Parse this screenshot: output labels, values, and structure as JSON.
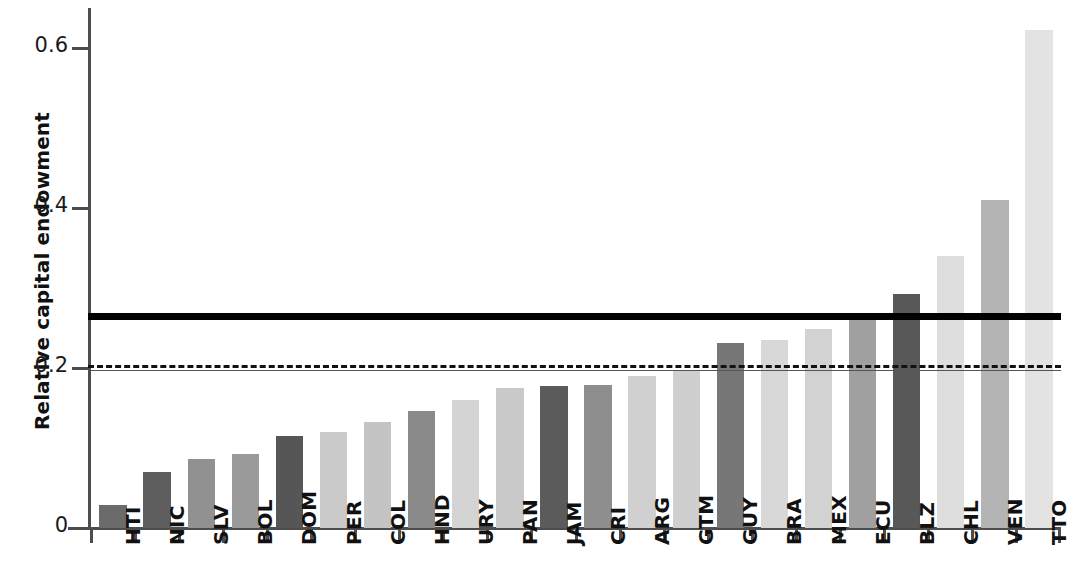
{
  "chart_data": {
    "type": "bar",
    "title": "",
    "xlabel": "",
    "ylabel": "Relative capital endowment",
    "ylim": [
      0,
      0.655
    ],
    "ytick_labels": [
      "0",
      "0.2",
      "0.4",
      "0.6"
    ],
    "ytick_values": [
      0,
      0.2,
      0.4,
      0.6
    ],
    "grid": false,
    "legend": null,
    "categories": [
      "HTI",
      "NIC",
      "SLV",
      "BOL",
      "DOM",
      "PER",
      "COL",
      "HND",
      "URY",
      "PAN",
      "JAM",
      "CRI",
      "ARG",
      "GTM",
      "GUY",
      "BRA",
      "MEX",
      "ECU",
      "BLZ",
      "CHL",
      "VEN",
      "TTO"
    ],
    "values": [
      0.029,
      0.07,
      0.086,
      0.092,
      0.115,
      0.12,
      0.132,
      0.146,
      0.16,
      0.175,
      0.178,
      0.179,
      0.19,
      0.196,
      0.231,
      0.235,
      0.249,
      0.264,
      0.293,
      0.34,
      0.41,
      0.622
    ],
    "bar_colors": [
      "#6b6b6b",
      "#5e5e5e",
      "#919191",
      "#9a9a9a",
      "#565656",
      "#cacaca",
      "#c4c4c4",
      "#8a8a8a",
      "#d4d4d4",
      "#c9c9c9",
      "#5b5b5b",
      "#8e8e8e",
      "#d0d0d0",
      "#cfcfcf",
      "#777777",
      "#d8d8d8",
      "#d2d2d2",
      "#a0a0a0",
      "#585858",
      "#dedede",
      "#b4b4b4",
      "#e3e3e3"
    ],
    "reference_lines": [
      {
        "name": "thick-solid-reference",
        "value": 0.265,
        "style": "solid-thick",
        "color": "#000000"
      },
      {
        "name": "dashed-reference",
        "value": 0.2025,
        "style": "dashed",
        "color": "#111111"
      },
      {
        "name": "thin-solid-reference",
        "value": 0.1975,
        "style": "solid-thin",
        "color": "#555555"
      }
    ],
    "axis_color": "#4d4d4d"
  }
}
